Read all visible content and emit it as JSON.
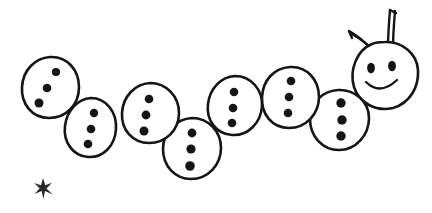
{
  "image": {
    "title": "Caterpillar line drawing",
    "subject": "caterpillar",
    "style": "hand-drawn black ink outline on white",
    "background_color": "#ffffff",
    "ink_color": "#151515",
    "width": 432,
    "height": 213
  },
  "caterpillar": {
    "label": "caterpillar",
    "segment_count": 7,
    "dots_per_segment": 3,
    "segments": [
      {
        "name": "body-segment-1",
        "cx": 50,
        "cy": 88,
        "rx": 30,
        "ry": 31,
        "rotate": -6,
        "dot_layout": "diagonal",
        "dots": [
          {
            "cx": 55,
            "cy": 72,
            "r": 4.0
          },
          {
            "cx": 47,
            "cy": 88,
            "r": 4.2
          },
          {
            "cx": 39,
            "cy": 102,
            "r": 4.4
          }
        ]
      },
      {
        "name": "body-segment-2",
        "cx": 91,
        "cy": 128,
        "rx": 27,
        "ry": 30,
        "rotate": 4,
        "dot_layout": "vertical",
        "dots": [
          {
            "cx": 94,
            "cy": 113,
            "r": 4.0
          },
          {
            "cx": 90,
            "cy": 128,
            "r": 4.2
          },
          {
            "cx": 87,
            "cy": 143,
            "r": 4.2
          }
        ]
      },
      {
        "name": "body-segment-3",
        "cx": 150,
        "cy": 113,
        "rx": 29,
        "ry": 30,
        "rotate": -3,
        "dot_layout": "vertical",
        "dots": [
          {
            "cx": 148,
            "cy": 99,
            "r": 4.2
          },
          {
            "cx": 145,
            "cy": 115,
            "r": 4.2
          },
          {
            "cx": 143,
            "cy": 130,
            "r": 4.4
          }
        ]
      },
      {
        "name": "body-segment-4",
        "cx": 192,
        "cy": 149,
        "rx": 29,
        "ry": 31,
        "rotate": 2,
        "dot_layout": "vertical",
        "dots": [
          {
            "cx": 192,
            "cy": 133,
            "r": 4.2
          },
          {
            "cx": 190,
            "cy": 149,
            "r": 4.4
          },
          {
            "cx": 189,
            "cy": 165,
            "r": 4.6
          }
        ]
      },
      {
        "name": "body-segment-5",
        "cx": 235,
        "cy": 106,
        "rx": 28,
        "ry": 30,
        "rotate": -4,
        "dot_layout": "vertical",
        "dots": [
          {
            "cx": 233,
            "cy": 92,
            "r": 4.2
          },
          {
            "cx": 232,
            "cy": 107,
            "r": 4.2
          },
          {
            "cx": 231,
            "cy": 123,
            "r": 4.2
          }
        ]
      },
      {
        "name": "body-segment-6",
        "cx": 290,
        "cy": 98,
        "rx": 29,
        "ry": 31,
        "rotate": 3,
        "dot_layout": "vertical",
        "dots": [
          {
            "cx": 290,
            "cy": 81,
            "r": 4.2
          },
          {
            "cx": 288,
            "cy": 97,
            "r": 4.2
          },
          {
            "cx": 287,
            "cy": 112,
            "r": 4.2
          }
        ]
      },
      {
        "name": "body-segment-7",
        "cx": 339,
        "cy": 120,
        "rx": 29,
        "ry": 30,
        "rotate": -2,
        "dot_layout": "vertical",
        "dots": [
          {
            "cx": 340,
            "cy": 103,
            "r": 4.6
          },
          {
            "cx": 341,
            "cy": 119,
            "r": 4.6
          },
          {
            "cx": 340,
            "cy": 135,
            "r": 4.6
          }
        ]
      }
    ],
    "head": {
      "name": "caterpillar-head",
      "cx": 385,
      "cy": 75,
      "rx": 32,
      "ry": 33,
      "rotate": 8,
      "face": {
        "eye_left": {
          "cx": 371,
          "cy": 68,
          "rx": 3.8,
          "ry": 5.2
        },
        "eye_right": {
          "cx": 392,
          "cy": 66,
          "rx": 3.8,
          "ry": 5.2
        },
        "smile": "M 367 83 Q 381 95 397 81"
      },
      "antennae": [
        {
          "name": "antenna-left",
          "path": "M 371 49 C 365 42 356 35 348 31",
          "tip": "M 348 31 L 350 37"
        },
        {
          "name": "antenna-right",
          "path": "M 391 46 C 391 36 391 22 390 10",
          "tip": "M 390 10 L 395 14"
        }
      ]
    }
  },
  "star": {
    "name": "star-mark",
    "label": "star",
    "points": 5,
    "cx": 43,
    "cy": 188,
    "outer_radius": 9,
    "inner_radius": 2.6
  }
}
